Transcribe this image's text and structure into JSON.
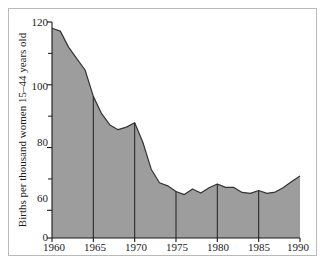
{
  "chart_data": {
    "type": "area",
    "title": "",
    "subtitle": "",
    "xlabel": "",
    "ylabel": "Births per thousand women 15–44 years old",
    "xlim": [
      1960,
      1990
    ],
    "ylim": [
      0,
      120
    ],
    "grid": false,
    "legend": null,
    "y_axis_break": true,
    "y_major_ticks": [
      0,
      60,
      80,
      100,
      120
    ],
    "y_major_tick_labels": [
      "0",
      "60",
      "80",
      "100",
      "120"
    ],
    "y_minor_ticks": [
      70,
      90,
      110
    ],
    "x_ticks": [
      1960,
      1965,
      1970,
      1975,
      1980,
      1985,
      1990
    ],
    "x_tick_labels": [
      "1960",
      "1965",
      "1970",
      "1975",
      "1980",
      "1985",
      "1990"
    ],
    "vertical_reference_years": [
      1965,
      1970,
      1975,
      1980,
      1985
    ],
    "fill_color": "#9d9d9d",
    "line_color": "#333333",
    "axis_color": "#1a1a1a",
    "frame_color": "#b9b9bc",
    "background_color": "#ffffff",
    "x": [
      1960,
      1961,
      1962,
      1963,
      1964,
      1965,
      1966,
      1967,
      1968,
      1969,
      1970,
      1971,
      1972,
      1973,
      1974,
      1975,
      1976,
      1977,
      1978,
      1979,
      1980,
      1981,
      1982,
      1983,
      1984,
      1985,
      1986,
      1987,
      1988,
      1989,
      1990
    ],
    "values": [
      118.0,
      117.1,
      112.0,
      108.3,
      104.7,
      96.3,
      90.8,
      87.2,
      85.7,
      86.5,
      87.9,
      81.6,
      73.1,
      68.8,
      67.8,
      66.0,
      65.0,
      66.8,
      65.5,
      67.2,
      68.4,
      67.3,
      67.3,
      65.7,
      65.4,
      66.3,
      65.4,
      65.8,
      67.3,
      69.2,
      70.9
    ],
    "annotations": []
  },
  "figure": {
    "axis_label_y": "Births per thousand women 15–44 years old",
    "y_labels": {
      "t120": "120",
      "t100": "100",
      "t80": "80",
      "t60": "60",
      "t0": "0"
    },
    "x_labels": {
      "x1960": "1960",
      "x1965": "1965",
      "x1970": "1970",
      "x1975": "1975",
      "x1980": "1980",
      "x1985": "1985",
      "x1990": "1990"
    }
  }
}
